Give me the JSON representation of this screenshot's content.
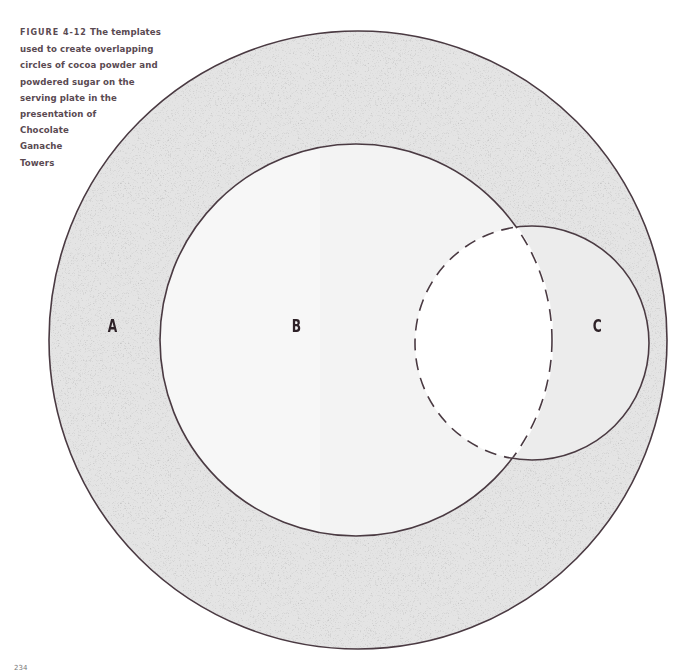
{
  "caption": {
    "figure_label": "FIGURE 4-12",
    "text": "The templates used to create overlapping circles of cocoa powder and powdered sugar on the serving plate in the presentation of Chocolate Ganache Towers",
    "lines": [
      "The templates",
      "used to create overlapping",
      "circles of cocoa powder and",
      "powdered sugar on the",
      "serving plate in the",
      "presentation of",
      "Chocolate",
      "Ganache",
      "Towers"
    ]
  },
  "circles": [
    {
      "id": "A",
      "label": "A",
      "cx": 358,
      "cy": 340,
      "r": 309,
      "fill": "#e2e2e2",
      "stroke": "#4a3a42",
      "style": "solid",
      "texture": "stipple"
    },
    {
      "id": "B",
      "label": "B",
      "cx": 356,
      "cy": 340,
      "r": 196,
      "fill": "#f3f3f3",
      "stroke": "#4a3a42",
      "style": "solid"
    },
    {
      "id": "C",
      "label": "C",
      "cx": 532,
      "cy": 343,
      "r": 117,
      "fill": "#ececec",
      "stroke": "#4a3a42",
      "style": "solid-outside-B, dashed-inside-B",
      "overlap_fill": "#ffffff"
    }
  ],
  "page_number": "234"
}
